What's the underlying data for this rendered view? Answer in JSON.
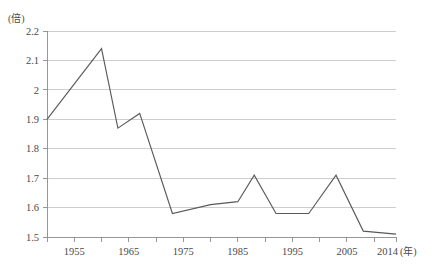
{
  "chart_data": {
    "type": "line",
    "title": "",
    "subtitle": "",
    "xlabel": "(年)",
    "ylabel": "(倍)",
    "y_unit_label": "(倍)",
    "x_unit_label": "(年)",
    "xlim": [
      1950,
      2014
    ],
    "ylim": [
      1.5,
      2.2
    ],
    "grid": true,
    "legend": "none",
    "y_ticks": [
      "1.5",
      "1.6",
      "1.7",
      "1.8",
      "1.9",
      "2",
      "2.1",
      "2.2"
    ],
    "y_tick_values": [
      1.5,
      1.6,
      1.7,
      1.8,
      1.9,
      2.0,
      2.1,
      2.2
    ],
    "x_ticks": [
      "1955",
      "1965",
      "1975",
      "1985",
      "1995",
      "2005",
      "2014"
    ],
    "x_tick_values": [
      1955,
      1965,
      1975,
      1985,
      1995,
      2005,
      2014
    ],
    "x_minor_tick_values": [
      1950,
      1955,
      1960,
      1965,
      1970,
      1975,
      1980,
      1985,
      1990,
      1995,
      2000,
      2005,
      2010,
      2014
    ],
    "series": [
      {
        "name": "倍率",
        "color": "#5a5a5a",
        "x": [
          1950,
          1960,
          1963,
          1967,
          1973,
          1980,
          1985,
          1988,
          1992,
          1998,
          2003,
          2008,
          2014
        ],
        "values": [
          1.9,
          2.14,
          1.87,
          1.92,
          1.58,
          1.61,
          1.62,
          1.71,
          1.58,
          1.58,
          1.71,
          1.52,
          1.51
        ]
      }
    ]
  },
  "colors": {
    "line": "#5a5a5a",
    "grid": "#b9b9b9",
    "axis": "#8c8c8c",
    "text": "#4a4a4a",
    "background": "#ffffff"
  }
}
